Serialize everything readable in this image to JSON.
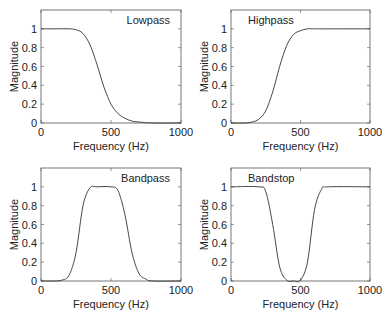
{
  "chart_data": [
    {
      "type": "line",
      "title": "Lowpass",
      "xlabel": "Frequency (Hz)",
      "ylabel": "Magnitude",
      "xlim": [
        0,
        1000
      ],
      "ylim": [
        0,
        1.2
      ],
      "xticks": [
        "0",
        "500",
        "1000"
      ],
      "yticks": [
        "0",
        "0.2",
        "0.4",
        "0.6",
        "0.8",
        "1"
      ],
      "grid": false,
      "legend": null,
      "series": [
        {
          "name": "Lowpass",
          "x": [
            0,
            100,
            200,
            250,
            300,
            350,
            400,
            450,
            500,
            550,
            600,
            650,
            700,
            800,
            1000
          ],
          "y": [
            1,
            1,
            1,
            0.99,
            0.95,
            0.83,
            0.62,
            0.38,
            0.2,
            0.1,
            0.05,
            0.02,
            0.01,
            0,
            0
          ]
        }
      ]
    },
    {
      "type": "line",
      "title": "Highpass",
      "xlabel": "Frequency (Hz)",
      "ylabel": "Magnitude",
      "xlim": [
        0,
        1000
      ],
      "ylim": [
        0,
        1.2
      ],
      "xticks": [
        "0",
        "500",
        "1000"
      ],
      "yticks": [
        "0",
        "0.2",
        "0.4",
        "0.6",
        "0.8",
        "1"
      ],
      "grid": false,
      "legend": null,
      "series": [
        {
          "name": "Highpass",
          "x": [
            0,
            100,
            150,
            200,
            250,
            300,
            350,
            400,
            450,
            500,
            550,
            600,
            700,
            1000
          ],
          "y": [
            0,
            0,
            0.01,
            0.04,
            0.13,
            0.33,
            0.6,
            0.82,
            0.94,
            0.98,
            1,
            1,
            1,
            1
          ]
        }
      ]
    },
    {
      "type": "line",
      "title": "Bandpass",
      "xlabel": "Frequency (Hz)",
      "ylabel": "Magnitude",
      "xlim": [
        0,
        1000
      ],
      "ylim": [
        0,
        1.2
      ],
      "xticks": [
        "0",
        "500",
        "1000"
      ],
      "yticks": [
        "0",
        "0.2",
        "0.4",
        "0.6",
        "0.8",
        "1"
      ],
      "grid": false,
      "legend": null,
      "series": [
        {
          "name": "Bandpass",
          "x": [
            0,
            100,
            150,
            200,
            250,
            300,
            350,
            400,
            500,
            550,
            600,
            650,
            700,
            750,
            800,
            1000
          ],
          "y": [
            0,
            0,
            0.01,
            0.06,
            0.3,
            0.8,
            0.99,
            1,
            1,
            0.96,
            0.7,
            0.3,
            0.08,
            0.02,
            0,
            0
          ]
        }
      ]
    },
    {
      "type": "line",
      "title": "Bandstop",
      "xlabel": "Frequency (Hz)",
      "ylabel": "Magnitude",
      "xlim": [
        0,
        1000
      ],
      "ylim": [
        0,
        1.2
      ],
      "xticks": [
        "0",
        "500",
        "1000"
      ],
      "yticks": [
        "0",
        "0.2",
        "0.4",
        "0.6",
        "0.8",
        "1"
      ],
      "grid": false,
      "legend": null,
      "series": [
        {
          "name": "Bandstop",
          "x": [
            0,
            200,
            250,
            300,
            350,
            400,
            450,
            500,
            550,
            600,
            650,
            700,
            1000
          ],
          "y": [
            1,
            1,
            0.95,
            0.6,
            0.15,
            0.01,
            0,
            0.01,
            0.2,
            0.75,
            0.97,
            1,
            1
          ]
        }
      ]
    }
  ],
  "colors": {
    "curve": "#333333",
    "axes": "#555555",
    "background": "#ffffff"
  }
}
